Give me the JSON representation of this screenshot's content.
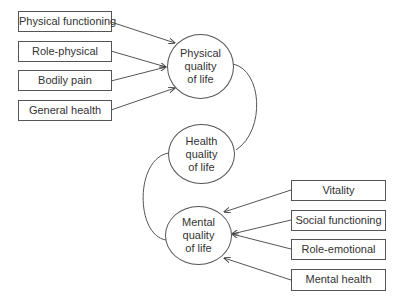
{
  "diagram": {
    "nodes": {
      "physical": {
        "lines": [
          "Physical",
          "quality",
          "of life"
        ]
      },
      "health": {
        "lines": [
          "Health",
          "quality",
          "of life"
        ]
      },
      "mental": {
        "lines": [
          "Mental",
          "quality",
          "of life"
        ]
      }
    },
    "left_inputs": [
      {
        "label": "Physical functioning"
      },
      {
        "label": "Role-physical"
      },
      {
        "label": "Bodily pain"
      },
      {
        "label": "General health"
      }
    ],
    "right_inputs": [
      {
        "label": "Vitality"
      },
      {
        "label": "Social functioning"
      },
      {
        "label": "Role-emotional"
      },
      {
        "label": "Mental health"
      }
    ],
    "edges": [
      {
        "from": "Physical functioning",
        "to": "Physical quality of life"
      },
      {
        "from": "Role-physical",
        "to": "Physical quality of life"
      },
      {
        "from": "Bodily pain",
        "to": "Physical quality of life"
      },
      {
        "from": "General health",
        "to": "Physical quality of life"
      },
      {
        "from": "Physical quality of life",
        "to": "Health quality of life",
        "style": "curve"
      },
      {
        "from": "Health quality of life",
        "to": "Mental quality of life",
        "style": "curve"
      },
      {
        "from": "Vitality",
        "to": "Mental quality of life"
      },
      {
        "from": "Social functioning",
        "to": "Mental quality of life"
      },
      {
        "from": "Role-emotional",
        "to": "Mental quality of life"
      },
      {
        "from": "Mental health",
        "to": "Mental quality of life"
      }
    ],
    "colors": {
      "line": "#555555",
      "text": "#333333",
      "background": "#ffffff"
    }
  }
}
